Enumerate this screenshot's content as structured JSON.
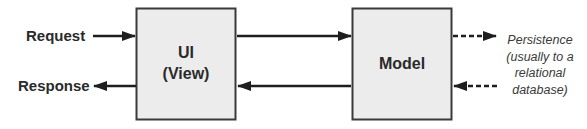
{
  "diagram": {
    "inputs": {
      "request_label": "Request",
      "response_label": "Response"
    },
    "ui_box": {
      "line1": "UI",
      "line2": "(View)"
    },
    "model_box": {
      "label": "Model"
    },
    "persistence_note": {
      "line1": "Persistence",
      "line2": "(usually to a",
      "line3": "relational",
      "line4": "database)"
    },
    "colors": {
      "box_fill": "#ececec",
      "box_border": "#3a3a3a",
      "arrow": "#1e1e1e",
      "text": "#2a2a2a"
    }
  }
}
